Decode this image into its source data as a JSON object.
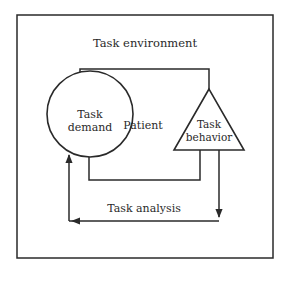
{
  "diagram": {
    "outer_label": "Task environment",
    "circle": {
      "line1": "Task",
      "line2": "demand"
    },
    "center_label": "Patient",
    "triangle": {
      "line1": "Task",
      "line2": "behavior"
    },
    "bottom_label": "Task analysis"
  },
  "colors": {
    "stroke": "#2a2a2a",
    "background": "#ffffff"
  }
}
